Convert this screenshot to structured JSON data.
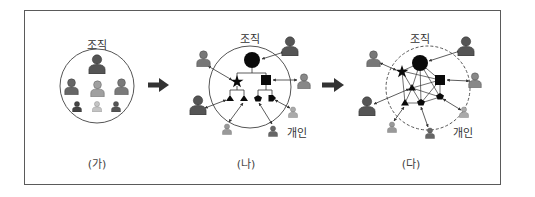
{
  "figure": {
    "panels": [
      {
        "id": "ga",
        "caption": "(가)",
        "circle_label": "조직",
        "circle_style": "solid",
        "members": [
          "person-large-dark",
          "person-medium",
          "person-medium-light",
          "person-medium",
          "person-small-dark",
          "person-small-light",
          "person-small-dark"
        ]
      },
      {
        "id": "na",
        "caption": "(나)",
        "circle_label": "조직",
        "individual_label": "개인",
        "circle_style": "solid",
        "structure": "hierarchy",
        "nodes": [
          "circle",
          "star",
          "square",
          "triangle",
          "triangle",
          "pentagon",
          "pentagon"
        ]
      },
      {
        "id": "da",
        "caption": "(다)",
        "circle_label": "조직",
        "individual_label": "개인",
        "circle_style": "dashed",
        "structure": "network",
        "nodes": [
          "circle",
          "star",
          "square",
          "triangle",
          "triangle",
          "pentagon",
          "pentagon"
        ]
      }
    ],
    "colors": {
      "border": "#5a5a5a",
      "person_dark": "#555555",
      "person_mid": "#7a7a7a",
      "person_light": "#a8a8a8",
      "node": "#0a0a0a",
      "arrow": "#3a3a3a"
    }
  }
}
